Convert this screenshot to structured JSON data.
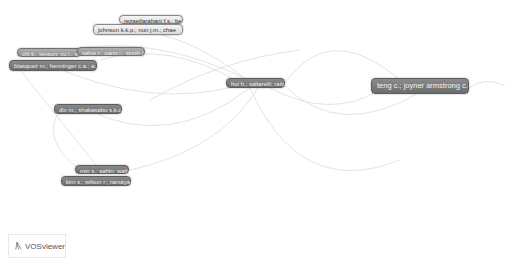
{
  "app": {
    "name": "VOSviewer"
  },
  "colors": {
    "edge": "#e4e4e4",
    "node_dark": "#777777",
    "node_light": "#e8e8e8",
    "background": "#ffffff"
  },
  "nodes": [
    {
      "id": "n1",
      "label": "rezaeifarahani f.s.; bell a.",
      "x": 119,
      "y": 15,
      "w": 64,
      "h": 9,
      "style": "light"
    },
    {
      "id": "n2",
      "label": "johnson k.k.p.; nun j.m.; chae",
      "x": 93,
      "y": 24,
      "w": 90,
      "h": 11,
      "style": "light"
    },
    {
      "id": "n3",
      "label": "chi k.; jenson; yu j.; wei",
      "x": 17,
      "y": 48,
      "w": 64,
      "h": 9,
      "style": "mid"
    },
    {
      "id": "n4",
      "label": "salve r.; gang j.; singh r.",
      "x": 77,
      "y": 47,
      "w": 68,
      "h": 9,
      "style": "mid"
    },
    {
      "id": "n5",
      "label": "blasquez m.; henninger c.a.; a.",
      "x": 9,
      "y": 60,
      "w": 88,
      "h": 11,
      "style": "dark"
    },
    {
      "id": "n6",
      "label": "hui h.; saltarelli; ratti",
      "x": 226,
      "y": 78,
      "w": 59,
      "h": 10,
      "style": "dark"
    },
    {
      "id": "n7",
      "label": "teng c.; joyner armstrong c.m.",
      "x": 371,
      "y": 78,
      "w": 98,
      "h": 16,
      "style": "dark",
      "big": true
    },
    {
      "id": "n8",
      "label": "dix m.; shakasabu s.k.c.",
      "x": 54,
      "y": 104,
      "w": 68,
      "h": 10,
      "style": "dark"
    },
    {
      "id": "n9",
      "label": "min s.; sahin; watt l.",
      "x": 75,
      "y": 165,
      "w": 54,
      "h": 9,
      "style": "dark"
    },
    {
      "id": "n10",
      "label": "kim s.; wilson r.; ramaya m.",
      "x": 61,
      "y": 176,
      "w": 70,
      "h": 10,
      "style": "dark"
    }
  ],
  "edges": [
    "M 140 30 Q 200 40 250 83",
    "M 60 52 Q 150 30 255 83",
    "M 50 65 Q 150 110 240 85",
    "M 88 110 Q 170 150 250 88",
    "M 130 170 Q 220 150 258 88",
    "M 100 60 Q 170 40 240 83",
    "M 285 83 Q 330 20 400 80",
    "M 285 86 Q 340 140 420 92",
    "M 270 88 Q 330 120 380 90",
    "M 469 88 Q 485 76 505 86",
    "M 60 110 Q 40 140 80 170",
    "M 150 100 Q 220 60 300 50",
    "M 250 88 Q 300 200 400 160",
    "M 20 70 Q 60 120 100 170"
  ]
}
